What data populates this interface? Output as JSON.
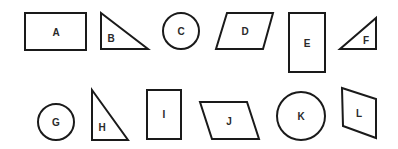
{
  "diagram": {
    "background": "#ffffff",
    "stroke_color": "#1a1a1a",
    "shapes": [
      {
        "label": "A",
        "type": "rectangle",
        "points": "25,13 86,13 86,50 25,50",
        "label_pos": [
          56,
          32
        ]
      },
      {
        "label": "B",
        "type": "right-triangle",
        "points": "101,13 101,49 148,49",
        "label_pos": [
          111,
          38
        ]
      },
      {
        "label": "C",
        "type": "circle",
        "cx": 181,
        "cy": 31,
        "r": 18,
        "label_pos": [
          181,
          31
        ]
      },
      {
        "label": "D",
        "type": "parallelogram",
        "points": "227,13 273,13 263,49 216,49",
        "label_pos": [
          245,
          31
        ]
      },
      {
        "label": "E",
        "type": "rectangle",
        "points": "289,13 325,13 325,72 289,72",
        "label_pos": [
          307,
          43
        ]
      },
      {
        "label": "F",
        "type": "right-triangle",
        "points": "376,18 376,49 340,49",
        "label_pos": [
          366,
          40
        ]
      },
      {
        "label": "G",
        "type": "circle",
        "cx": 56,
        "cy": 122,
        "r": 18,
        "label_pos": [
          56,
          122
        ]
      },
      {
        "label": "H",
        "type": "right-triangle",
        "points": "92,90 92,140 128,140",
        "label_pos": [
          102,
          127
        ]
      },
      {
        "label": "I",
        "type": "rectangle",
        "points": "147,90 181,90 181,139 147,139",
        "label_pos": [
          164,
          114
        ]
      },
      {
        "label": "J",
        "type": "parallelogram",
        "points": "200,102 247,102 259,139 212,139",
        "label_pos": [
          229,
          120
        ]
      },
      {
        "label": "K",
        "type": "circle",
        "cx": 301,
        "cy": 116,
        "r": 24,
        "label_pos": [
          301,
          116
        ]
      },
      {
        "label": "L",
        "type": "quadrilateral",
        "points": "342,88 376,99 376,138 343,126",
        "label_pos": [
          359,
          113
        ]
      }
    ]
  }
}
